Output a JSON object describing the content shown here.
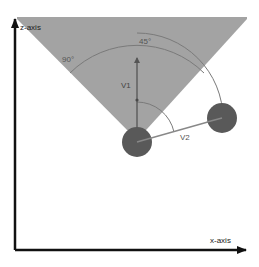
{
  "diagram": {
    "title": "",
    "axes": {
      "z_label": "z-axis",
      "x_label": "x-axis"
    },
    "cone": {
      "angle_label_half": "45°",
      "angle_label_full": "90°",
      "fill_color": "#a3a3a3"
    },
    "vectors": {
      "v1_label": "V1",
      "v2_label": "V2"
    },
    "objects": {
      "origin_color": "#595959",
      "target_color": "#595959"
    }
  }
}
